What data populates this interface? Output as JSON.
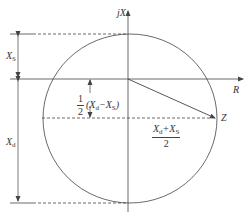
{
  "diagram": {
    "type": "impedance-circle",
    "axes": {
      "vertical_label": "jX",
      "horizontal_label": "R"
    },
    "labels": {
      "xs": {
        "main": "X",
        "sub": "S"
      },
      "xd": {
        "main": "X",
        "sub": "d"
      },
      "z": "Z",
      "half_diff": {
        "num": "1",
        "den": "2",
        "expr_pre": "(X",
        "sub1": "d",
        "mid": "−X",
        "sub2": "S",
        "post": ")"
      },
      "mean": {
        "n1": "X",
        "s1": "d",
        "plus": "+X",
        "s2": "S",
        "den": "2"
      }
    },
    "colors": {
      "stroke": "#444444",
      "text": "#333333",
      "background": "#ffffff"
    }
  }
}
